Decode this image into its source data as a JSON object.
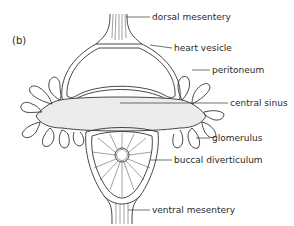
{
  "figure": {
    "panel_label": "(b)",
    "labels": {
      "dorsal_mesentery": "dorsal mesentery",
      "heart_vesicle": "heart vesicle",
      "peritoneum": "peritoneum",
      "central_sinus": "central sinus",
      "glomerulus": "glomerulus",
      "buccal_diverticulum": "buccal diverticulum",
      "ventral_mesentery": "ventral mesentery"
    },
    "colors": {
      "line": "#333333",
      "sinus_fill": "#ececec",
      "background": "#ffffff"
    }
  }
}
